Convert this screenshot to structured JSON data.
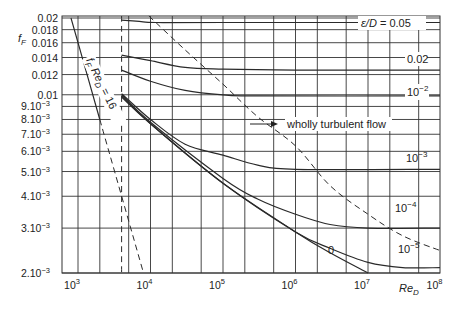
{
  "chart_data": {
    "type": "line",
    "title": "",
    "xlabel": "Re_D",
    "ylabel": "f_F",
    "x_scale": "log",
    "y_scale": "log",
    "xlim": [
      600,
      100000000
    ],
    "ylim": [
      0.002,
      0.0205
    ],
    "grid": true,
    "x_ticks": [
      {
        "value": 1000,
        "label": "10",
        "exp": "3"
      },
      {
        "value": 10000,
        "label": "10",
        "exp": "4"
      },
      {
        "value": 100000,
        "label": "10",
        "exp": "5"
      },
      {
        "value": 1000000,
        "label": "10",
        "exp": "6"
      },
      {
        "value": 10000000,
        "label": "10",
        "exp": "7"
      },
      {
        "value": 100000000,
        "label": "10",
        "exp": "8"
      }
    ],
    "y_ticks": [
      {
        "value": 0.02,
        "label": "0.02"
      },
      {
        "value": 0.018,
        "label": "0.018"
      },
      {
        "value": 0.016,
        "label": "0.016"
      },
      {
        "value": 0.014,
        "label": "0.014"
      },
      {
        "value": 0.012,
        "label": "0.012"
      },
      {
        "value": 0.01,
        "label": "0.01"
      },
      {
        "value": 0.009,
        "label": "9.10",
        "exp": "−3"
      },
      {
        "value": 0.008,
        "label": "8.10",
        "exp": "−3"
      },
      {
        "value": 0.007,
        "label": "7.10",
        "exp": "−3"
      },
      {
        "value": 0.006,
        "label": "6.10",
        "exp": "−3"
      },
      {
        "value": 0.005,
        "label": "5.10",
        "exp": "−3"
      },
      {
        "value": 0.004,
        "label": "4.10",
        "exp": "−3"
      },
      {
        "value": 0.003,
        "label": "3.10",
        "exp": "−3"
      },
      {
        "value": 0.002,
        "label": "2.10",
        "exp": "−3"
      }
    ],
    "x_gridlines": [
      1000,
      2000,
      5000,
      10000,
      20000,
      50000,
      100000,
      200000,
      500000,
      1000000,
      2000000,
      5000000,
      10000000,
      20000000,
      50000000,
      100000000
    ],
    "series": [
      {
        "name": "laminar f_F Re_D = 16",
        "style": "solid",
        "points": [
          [
            800,
            0.02
          ],
          [
            1000,
            0.016
          ],
          [
            2000,
            0.008
          ]
        ]
      },
      {
        "name": "laminar f_F Re_D = 16 (extension)",
        "style": "dashed",
        "points": [
          [
            2000,
            0.008
          ],
          [
            8000,
            0.002
          ]
        ]
      },
      {
        "name": "transition Re_D = 4000",
        "style": "dashed",
        "points": [
          [
            4000,
            0.0205
          ],
          [
            4000,
            0.002
          ]
        ]
      },
      {
        "name": "wholly turbulent flow boundary",
        "style": "dashed",
        "points": [
          [
            9500,
            0.0205
          ],
          [
            30000,
            0.015
          ],
          [
            100000,
            0.011
          ],
          [
            300000,
            0.0082
          ],
          [
            1000000,
            0.0063
          ],
          [
            3000000,
            0.0044
          ],
          [
            10000000,
            0.0034
          ],
          [
            30000000,
            0.0028
          ],
          [
            100000000,
            0.00245
          ]
        ]
      },
      {
        "name": "ε/D = 0.05",
        "style": "solid",
        "points": [
          [
            4000,
            0.0196
          ],
          [
            7000,
            0.0194
          ],
          [
            12000,
            0.0192
          ],
          [
            100000,
            0.0192
          ],
          [
            100000000,
            0.0192
          ]
        ]
      },
      {
        "name": "ε/D = 0.02",
        "style": "solid",
        "points": [
          [
            4000,
            0.0143
          ],
          [
            10000,
            0.0136
          ],
          [
            30000,
            0.0128
          ],
          [
            100000,
            0.0126
          ],
          [
            1000000,
            0.0125
          ],
          [
            100000000,
            0.0125
          ]
        ]
      },
      {
        "name": "ε/D = 10^-2",
        "style": "solid",
        "points": [
          [
            4000,
            0.0125
          ],
          [
            10000,
            0.0113
          ],
          [
            30000,
            0.0104
          ],
          [
            100000,
            0.01
          ],
          [
            300000,
            0.0099
          ],
          [
            100000000,
            0.0099
          ]
        ]
      },
      {
        "name": "ε/D = 10^-3",
        "style": "solid",
        "points": [
          [
            4000,
            0.0101
          ],
          [
            10000,
            0.008
          ],
          [
            30000,
            0.0064
          ],
          [
            100000,
            0.0058
          ],
          [
            300000,
            0.0053
          ],
          [
            1000000,
            0.0051
          ],
          [
            100000000,
            0.0051
          ]
        ]
      },
      {
        "name": "ε/D = 10^-4",
        "style": "solid",
        "points": [
          [
            4000,
            0.01
          ],
          [
            10000,
            0.0078
          ],
          [
            100000,
            0.0047
          ],
          [
            300000,
            0.0039
          ],
          [
            1000000,
            0.0034
          ],
          [
            3000000,
            0.0031
          ],
          [
            10000000,
            0.003
          ],
          [
            100000000,
            0.003
          ]
        ]
      },
      {
        "name": "ε/D = 10^-5",
        "style": "solid",
        "points": [
          [
            4000,
            0.0099
          ],
          [
            10000,
            0.0077
          ],
          [
            100000,
            0.0045
          ],
          [
            1000000,
            0.0029
          ],
          [
            3000000,
            0.0025
          ],
          [
            10000000,
            0.0022
          ],
          [
            30000000,
            0.0021
          ],
          [
            100000000,
            0.0021
          ]
        ]
      },
      {
        "name": "ε/D = 0 (smooth)",
        "style": "solid",
        "points": [
          [
            4000,
            0.0098
          ],
          [
            10000,
            0.0077
          ],
          [
            100000,
            0.0045
          ],
          [
            1000000,
            0.0029
          ],
          [
            3000000,
            0.0024
          ],
          [
            10000000,
            0.002
          ]
        ]
      }
    ],
    "annotations": [
      {
        "text": "f_F Re_D = 16",
        "at": [
          1500,
          0.011
        ],
        "rotation": 64
      },
      {
        "text": "wholly turbulent flow",
        "arrow": true,
        "at": [
          300000,
          0.0075
        ]
      },
      {
        "text": "ε/D = 0.05",
        "at": [
          20000000,
          0.02
        ]
      },
      {
        "text": "0.02",
        "at": [
          30000000,
          0.0137
        ]
      },
      {
        "text": "10^-2",
        "at": [
          30000000,
          0.0104
        ]
      },
      {
        "text": "10^-3",
        "at": [
          30000000,
          0.006
        ]
      },
      {
        "text": "10^-4",
        "at": [
          30000000,
          0.0033
        ]
      },
      {
        "text": "10^-5",
        "at": [
          30000000,
          0.00237
        ]
      },
      {
        "text": "0",
        "at": [
          2000000,
          0.00225
        ]
      }
    ]
  },
  "labels": {
    "ylabel_main": "f",
    "ylabel_sub": "F",
    "xlabel_main": "Re",
    "xlabel_sub": "D",
    "laminar_f": "f",
    "laminar_fsub": "F",
    "laminar_re": " Re",
    "laminar_resub": "D",
    "laminar_eq": " = 16",
    "turbulent": "wholly turbulent flow",
    "eps_prefix": "ε/D",
    "eps_005": " = 0.05",
    "eps_002": "0.02",
    "eps_1e2": "10",
    "eps_1e2_exp": "−2",
    "eps_1e3": "10",
    "eps_1e3_exp": "−3",
    "eps_1e4": "10",
    "eps_1e4_exp": "−4",
    "eps_1e5": "10",
    "eps_1e5_exp": "−5",
    "eps_0": "0"
  },
  "colors": {
    "line": "#2a2a2a",
    "grid": "#333333",
    "background": "#ffffff"
  }
}
